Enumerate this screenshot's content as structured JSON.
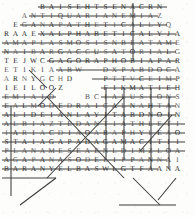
{
  "document": {
    "kind": "word-search-puzzle",
    "title": "",
    "description": "Scanned word search grid with solution lines drawn over found words",
    "grid": {
      "rows": 19,
      "cols": 20,
      "cell_size_px": 9,
      "origin_x_px": 2,
      "origin_y_px": 2,
      "letters": [
        " ",
        " ",
        " ",
        " ",
        "B",
        "A",
        "I",
        "S",
        "E",
        "H",
        "T",
        "S",
        "E",
        "N",
        "A",
        "C",
        "R",
        "N",
        " ",
        " ",
        " ",
        " ",
        "A",
        "N",
        "T",
        "I",
        "Q",
        "U",
        "A",
        "R",
        "I",
        "A",
        "N",
        "E",
        "M",
        "I",
        "A",
        "Z",
        " ",
        " ",
        " ",
        "E",
        "G",
        "A",
        "N",
        "A",
        "P",
        "A",
        "T",
        "H",
        "E",
        "T",
        "I",
        "C",
        "A",
        "L",
        "L",
        "Y",
        "Q",
        " ",
        "R",
        "A",
        "A",
        "E",
        "X",
        "A",
        "L",
        "P",
        "H",
        "A",
        "B",
        "E",
        "T",
        "I",
        "C",
        "A",
        "L",
        "Y",
        "J",
        "A",
        "A",
        "M",
        "A",
        "P",
        "L",
        "A",
        "S",
        "M",
        "O",
        "S",
        "I",
        "S",
        "N",
        "B",
        "E",
        "A",
        "T",
        "A",
        "M",
        "E",
        "N",
        "A",
        "I",
        "B",
        "A",
        "R",
        "G",
        "A",
        "C",
        "C",
        "U",
        "S",
        "A",
        "T",
        "O",
        "R",
        "I",
        "A",
        "L",
        "G",
        "T",
        "E",
        "J",
        "W",
        "C",
        "G",
        "A",
        "G",
        "O",
        "R",
        "A",
        "P",
        "H",
        "O",
        "B",
        "I",
        "A",
        "P",
        "A",
        "R",
        "E",
        "T",
        "I",
        "K",
        "I",
        "A",
        "A",
        "B",
        "W",
        " ",
        " ",
        "D",
        "X",
        "P",
        "A",
        "B",
        "D",
        "O",
        "C",
        "A",
        "A",
        "R",
        "N",
        "Y",
        "G",
        "C",
        "H",
        "D",
        " ",
        " ",
        " ",
        "P",
        "T",
        "T",
        "V",
        "C",
        "E",
        "I",
        "M",
        "P",
        "I",
        "E",
        "I",
        "L",
        "O",
        "O",
        "Z",
        " ",
        " ",
        " ",
        " ",
        "F",
        "I",
        "K",
        "M",
        "A",
        "T",
        "I",
        "E",
        "H",
        "E",
        "M",
        "I",
        "A",
        "I",
        "D",
        " ",
        " ",
        " ",
        "B",
        "C",
        "I",
        "A",
        "L",
        "U",
        "S",
        "I",
        "O",
        "N",
        "S",
        "E",
        "A",
        "L",
        "M",
        "O",
        "D",
        "E",
        "D",
        "R",
        "A",
        "I",
        "C",
        "A",
        "L",
        "N",
        "A",
        "H",
        "T",
        "A",
        "N",
        "A",
        "L",
        "I",
        "D",
        "E",
        "I",
        "A",
        "N",
        "L",
        "A",
        "Y",
        "I",
        "T",
        "A",
        "B",
        "D",
        "N",
        "O",
        "I",
        "N",
        "A",
        "L",
        "B",
        "I",
        "A",
        "Z",
        "T",
        "E",
        "D",
        "A",
        "N",
        "T",
        "I",
        "A",
        "T",
        "H",
        "L",
        "E",
        "T",
        "I",
        "I",
        "A",
        "R",
        "I",
        "A",
        "C",
        "D",
        "I",
        "A",
        "O",
        "A",
        "R",
        "A",
        "P",
        "H",
        "Y",
        "L",
        "E",
        "A",
        "O",
        "S",
        "T",
        "A",
        "I",
        "A",
        "G",
        "A",
        "P",
        "A",
        "D",
        "A",
        "G",
        "A",
        "M",
        "A",
        "C",
        "I",
        "T",
        "I",
        "I",
        "P",
        "L",
        "A",
        "N",
        "A",
        "M",
        "E",
        "S",
        "E",
        "A",
        "E",
        "N",
        "L",
        "D",
        "I",
        "M",
        "Z",
        "L",
        "O",
        "A",
        "A",
        "G",
        "A",
        "P",
        "A",
        "N",
        "A",
        "S",
        "O",
        "D",
        "E",
        "L",
        "I",
        "P",
        "P",
        "A",
        "N",
        "N",
        "A",
        "I",
        "B",
        "A",
        "R",
        "A",
        "N",
        "Y",
        "E",
        "L",
        "B",
        "A",
        "S",
        "W",
        "L",
        "G",
        "T",
        "F",
        "A",
        "A",
        "N",
        "A"
      ]
    },
    "solution_marks": {
      "horizontal_count": 22,
      "vertical_count": 6,
      "diagonal_count": 8,
      "note": "lines struck through letters of located answers"
    }
  }
}
